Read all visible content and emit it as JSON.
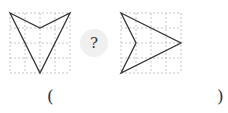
{
  "figure": {
    "left_panel": {
      "grid": {
        "x": 10,
        "y": 13,
        "cols": 4,
        "rows": 4,
        "cell": 15
      },
      "shape_points": [
        [
          10,
          13
        ],
        [
          40,
          28
        ],
        [
          70,
          13
        ],
        [
          40,
          73
        ]
      ]
    },
    "right_panel": {
      "grid": {
        "x": 121,
        "y": 13,
        "cols": 4,
        "rows": 4,
        "cell": 15
      },
      "shape_points": [
        [
          121,
          13
        ],
        [
          181,
          43
        ],
        [
          121,
          73
        ],
        [
          136,
          43
        ]
      ]
    },
    "question_mark": "?",
    "answer_open": "(",
    "answer_close": ")"
  },
  "colors": {
    "grid": "#b8b8b8",
    "shape": "#333333",
    "bubble": "#f0f0f0"
  }
}
